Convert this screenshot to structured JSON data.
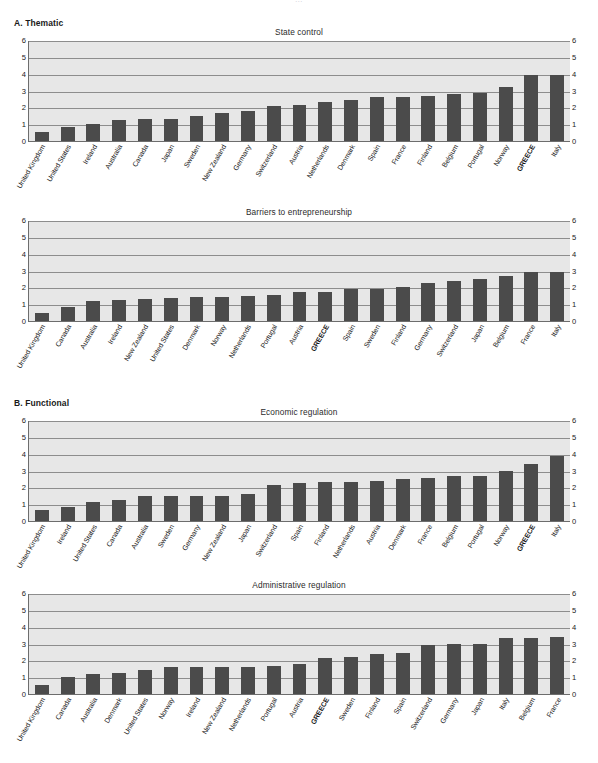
{
  "document": {
    "top_title_fragment": "…"
  },
  "panels": [
    {
      "label": "A. Thematic"
    },
    {
      "label": "B. Functional"
    }
  ],
  "axis": {
    "ticks": [
      0,
      1,
      2,
      3,
      4,
      5,
      6
    ],
    "min": 0,
    "max": 6
  },
  "colors": {
    "bar": "#4b4b4b",
    "plot_background": "#e7e7e7",
    "grid": "#8d8d8d",
    "axis": "#6d6d6d",
    "text": "#1a1a1a"
  },
  "highlight_category": "GREECE",
  "chart_data": [
    {
      "type": "bar",
      "title": "State control",
      "xlabel": "",
      "ylabel": "",
      "ylim": [
        0,
        6
      ],
      "yticks": [
        0,
        1,
        2,
        3,
        4,
        5,
        6
      ],
      "grid": true,
      "legend": "none",
      "categories": [
        "United Kingdom",
        "United States",
        "Ireland",
        "Australia",
        "Canada",
        "Japan",
        "Sweden",
        "New Zealand",
        "Germany",
        "Switzerland",
        "Austria",
        "Netherlands",
        "Denmark",
        "Spain",
        "France",
        "Finland",
        "Belgium",
        "Portugal",
        "Norway",
        "GREECE",
        "Italy"
      ],
      "values": [
        0.55,
        0.85,
        1.0,
        1.25,
        1.3,
        1.3,
        1.5,
        1.65,
        1.8,
        2.1,
        2.15,
        2.3,
        2.45,
        2.6,
        2.6,
        2.7,
        2.8,
        2.85,
        3.2,
        3.9,
        3.95
      ]
    },
    {
      "type": "bar",
      "title": "Barriers to entrepreneurship",
      "xlabel": "",
      "ylabel": "",
      "ylim": [
        0,
        6
      ],
      "yticks": [
        0,
        1,
        2,
        3,
        4,
        5,
        6
      ],
      "grid": true,
      "legend": "none",
      "categories": [
        "United Kingdom",
        "Canada",
        "Australia",
        "Ireland",
        "New Zealand",
        "United States",
        "Denmark",
        "Norway",
        "Netherlands",
        "Portugal",
        "Austria",
        "GREECE",
        "Spain",
        "Sweden",
        "Finland",
        "Germany",
        "Switzerland",
        "Japan",
        "Belgium",
        "France",
        "Italy"
      ],
      "values": [
        0.5,
        0.85,
        1.2,
        1.25,
        1.3,
        1.35,
        1.4,
        1.45,
        1.5,
        1.55,
        1.7,
        1.75,
        1.9,
        1.9,
        2.05,
        2.25,
        2.4,
        2.5,
        2.7,
        2.9,
        2.9
      ]
    },
    {
      "type": "bar",
      "title": "Economic regulation",
      "xlabel": "",
      "ylabel": "",
      "ylim": [
        0,
        6
      ],
      "yticks": [
        0,
        1,
        2,
        3,
        4,
        5,
        6
      ],
      "grid": true,
      "legend": "none",
      "categories": [
        "United Kingdom",
        "Ireland",
        "United States",
        "Canada",
        "Australia",
        "Sweden",
        "Germany",
        "New Zealand",
        "Japan",
        "Switzerland",
        "Spain",
        "Finland",
        "Netherlands",
        "Austria",
        "Denmark",
        "France",
        "Belgium",
        "Portugal",
        "Norway",
        "GREECE",
        "Italy"
      ],
      "values": [
        0.65,
        0.85,
        1.1,
        1.25,
        1.5,
        1.5,
        1.5,
        1.5,
        1.6,
        2.15,
        2.25,
        2.3,
        2.3,
        2.35,
        2.5,
        2.55,
        2.65,
        2.7,
        2.95,
        3.4,
        3.85
      ]
    },
    {
      "type": "bar",
      "title": "Administrative regulation",
      "xlabel": "",
      "ylabel": "",
      "ylim": [
        0,
        6
      ],
      "yticks": [
        0,
        1,
        2,
        3,
        4,
        5,
        6
      ],
      "grid": true,
      "legend": "none",
      "categories": [
        "United Kingdom",
        "Canada",
        "Australia",
        "Denmark",
        "United States",
        "Norway",
        "Ireland",
        "New Zealand",
        "Netherlands",
        "Portugal",
        "Austria",
        "GREECE",
        "Sweden",
        "Finland",
        "Spain",
        "Switzerland",
        "Germany",
        "Japan",
        "Italy",
        "Belgium",
        "France"
      ],
      "values": [
        0.55,
        1.0,
        1.2,
        1.25,
        1.4,
        1.6,
        1.6,
        1.6,
        1.6,
        1.65,
        1.8,
        2.15,
        2.2,
        2.4,
        2.45,
        2.9,
        2.95,
        2.95,
        3.3,
        3.3,
        3.4
      ]
    }
  ]
}
